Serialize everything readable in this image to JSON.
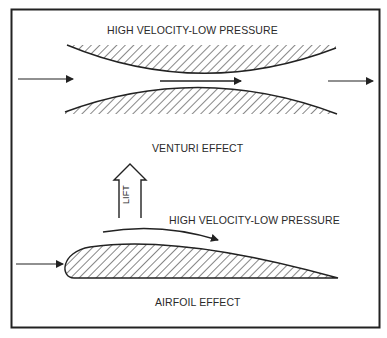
{
  "venturi": {
    "top_label": "HIGH VELOCITY-LOW PRESSURE",
    "caption": "VENTURI EFFECT"
  },
  "airfoil": {
    "lift_label": "LIFT",
    "top_label": "HIGH VELOCITY-LOW PRESSURE",
    "caption": "AIRFOIL EFFECT"
  },
  "colors": {
    "ink": "#222222",
    "background": "#ffffff"
  }
}
